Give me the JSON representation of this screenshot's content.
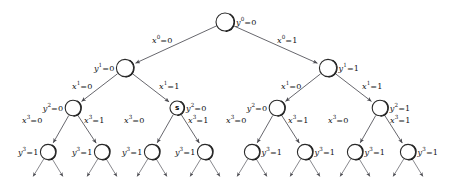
{
  "diagram": {
    "background_color": "#ffffff",
    "node_fill": "#ffffff",
    "node_stroke": "#2a2a2a",
    "edge_color": "#56565c",
    "special_node_marker": "s",
    "nodes": [
      {
        "id": "root",
        "label": "y",
        "sup": "0",
        "value": "0",
        "cx": 225,
        "cy": 22,
        "r": 9.0,
        "label_side": "right",
        "marker": ""
      },
      {
        "id": "n-l",
        "label": "y",
        "sup": "1",
        "value": "0",
        "cx": 125,
        "cy": 68,
        "r": 8.6,
        "label_side": "left",
        "marker": ""
      },
      {
        "id": "n-r",
        "label": "y",
        "sup": "1",
        "value": "1",
        "cx": 328,
        "cy": 68,
        "r": 8.6,
        "label_side": "right",
        "marker": ""
      },
      {
        "id": "n-ll",
        "label": "y",
        "sup": "2",
        "value": "0",
        "cx": 73,
        "cy": 108,
        "r": 7.8,
        "label_side": "left",
        "marker": ""
      },
      {
        "id": "n-lr",
        "label": "y",
        "sup": "2",
        "value": "0",
        "cx": 177,
        "cy": 108,
        "r": 7.0,
        "label_side": "right",
        "marker": "s"
      },
      {
        "id": "n-rl",
        "label": "y",
        "sup": "2",
        "value": "0",
        "cx": 277,
        "cy": 108,
        "r": 7.8,
        "label_side": "left",
        "marker": ""
      },
      {
        "id": "n-rr",
        "label": "y",
        "sup": "2",
        "value": "1",
        "cx": 380,
        "cy": 108,
        "r": 7.8,
        "label_side": "right",
        "marker": ""
      },
      {
        "id": "n-lll",
        "label": "y",
        "sup": "3",
        "value": "1",
        "cx": 48,
        "cy": 152,
        "r": 7.6,
        "label_side": "left",
        "marker": ""
      },
      {
        "id": "n-llr",
        "label": "y",
        "sup": "3",
        "value": "1",
        "cx": 102,
        "cy": 152,
        "r": 7.6,
        "label_side": "left",
        "marker": ""
      },
      {
        "id": "n-lrl",
        "label": "y",
        "sup": "3",
        "value": "1",
        "cx": 152,
        "cy": 152,
        "r": 7.6,
        "label_side": "left",
        "marker": ""
      },
      {
        "id": "n-lrr",
        "label": "y",
        "sup": "3",
        "value": "1",
        "cx": 205,
        "cy": 152,
        "r": 7.6,
        "label_side": "left",
        "marker": ""
      },
      {
        "id": "n-rll",
        "label": "y",
        "sup": "3",
        "value": "1",
        "cx": 252,
        "cy": 152,
        "r": 7.6,
        "label_side": "right",
        "marker": ""
      },
      {
        "id": "n-rlr",
        "label": "y",
        "sup": "3",
        "value": "1",
        "cx": 305,
        "cy": 152,
        "r": 7.6,
        "label_side": "right",
        "marker": ""
      },
      {
        "id": "n-rrl",
        "label": "y",
        "sup": "3",
        "value": "1",
        "cx": 355,
        "cy": 152,
        "r": 7.6,
        "label_side": "right",
        "marker": ""
      },
      {
        "id": "n-rrr",
        "label": "y",
        "sup": "3",
        "value": "1",
        "cx": 408,
        "cy": 152,
        "r": 7.6,
        "label_side": "right",
        "marker": ""
      }
    ],
    "edges": [
      {
        "id": "e-root-l",
        "from": "root",
        "to": "n-l",
        "label": "x",
        "sup": "0",
        "value": "0",
        "lx": 152,
        "ly": 40
      },
      {
        "id": "e-root-r",
        "from": "root",
        "to": "n-r",
        "label": "x",
        "sup": "0",
        "value": "1",
        "lx": 277,
        "ly": 40
      },
      {
        "id": "e-l-ll",
        "from": "n-l",
        "to": "n-ll",
        "label": "x",
        "sup": "1",
        "value": "0",
        "lx": 72,
        "ly": 86
      },
      {
        "id": "e-l-lr",
        "from": "n-l",
        "to": "n-lr",
        "label": "x",
        "sup": "1",
        "value": "1",
        "lx": 159,
        "ly": 86
      },
      {
        "id": "e-r-rl",
        "from": "n-r",
        "to": "n-rl",
        "label": "x",
        "sup": "1",
        "value": "0",
        "lx": 281,
        "ly": 86
      },
      {
        "id": "e-r-rr",
        "from": "n-r",
        "to": "n-rr",
        "label": "x",
        "sup": "1",
        "value": "1",
        "lx": 362,
        "ly": 86
      },
      {
        "id": "e-ll-a",
        "from": "n-ll",
        "to": "n-lll",
        "label": "x",
        "sup": "3",
        "value": "0",
        "lx": 22,
        "ly": 120
      },
      {
        "id": "e-ll-b",
        "from": "n-ll",
        "to": "n-llr",
        "label": "x",
        "sup": "3",
        "value": "1",
        "lx": 84,
        "ly": 120
      },
      {
        "id": "e-lr-a",
        "from": "n-lr",
        "to": "n-lrl",
        "label": "x",
        "sup": "3",
        "value": "0",
        "lx": 124,
        "ly": 120
      },
      {
        "id": "e-lr-b",
        "from": "n-lr",
        "to": "n-lrr",
        "label": "x",
        "sup": "3",
        "value": "1",
        "lx": 188,
        "ly": 120
      },
      {
        "id": "e-rl-a",
        "from": "n-rl",
        "to": "n-rll",
        "label": "x",
        "sup": "3",
        "value": "0",
        "lx": 226,
        "ly": 120
      },
      {
        "id": "e-rl-b",
        "from": "n-rl",
        "to": "n-rlr",
        "label": "x",
        "sup": "3",
        "value": "1",
        "lx": 288,
        "ly": 120
      },
      {
        "id": "e-rr-a",
        "from": "n-rr",
        "to": "n-rrl",
        "label": "x",
        "sup": "3",
        "value": "0",
        "lx": 328,
        "ly": 120
      },
      {
        "id": "e-rr-b",
        "from": "n-rr",
        "to": "n-rrr",
        "label": "x",
        "sup": "3",
        "value": "1",
        "lx": 390,
        "ly": 120
      }
    ],
    "dangling_edges": [
      {
        "id": "d-0",
        "from": "n-lll",
        "dir": "left"
      },
      {
        "id": "d-1",
        "from": "n-lll",
        "dir": "right"
      },
      {
        "id": "d-2",
        "from": "n-llr",
        "dir": "left"
      },
      {
        "id": "d-3",
        "from": "n-llr",
        "dir": "right"
      },
      {
        "id": "d-4",
        "from": "n-lrl",
        "dir": "left"
      },
      {
        "id": "d-5",
        "from": "n-lrl",
        "dir": "right"
      },
      {
        "id": "d-6",
        "from": "n-lrr",
        "dir": "left"
      },
      {
        "id": "d-7",
        "from": "n-lrr",
        "dir": "right"
      },
      {
        "id": "d-8",
        "from": "n-rll",
        "dir": "left"
      },
      {
        "id": "d-9",
        "from": "n-rll",
        "dir": "right"
      },
      {
        "id": "d-10",
        "from": "n-rlr",
        "dir": "left"
      },
      {
        "id": "d-11",
        "from": "n-rlr",
        "dir": "right"
      },
      {
        "id": "d-12",
        "from": "n-rrl",
        "dir": "left"
      },
      {
        "id": "d-13",
        "from": "n-rrl",
        "dir": "right"
      },
      {
        "id": "d-14",
        "from": "n-rrr",
        "dir": "left"
      },
      {
        "id": "d-15",
        "from": "n-rrr",
        "dir": "right"
      }
    ]
  }
}
